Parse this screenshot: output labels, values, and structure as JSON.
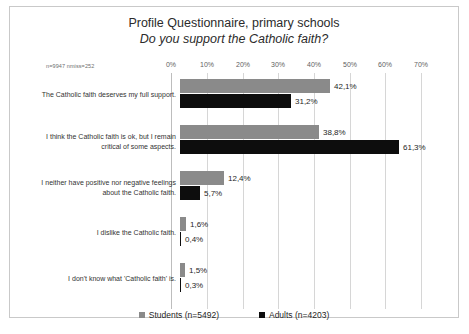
{
  "chart_data": {
    "type": "bar",
    "orientation": "horizontal",
    "title": "Profile Questionnaire, primary schools",
    "subtitle": "Do you support the Catholic faith?",
    "note": "n=9947 nmiss=252",
    "xlabel": "",
    "ylabel": "",
    "xlim": [
      0,
      70
    ],
    "xtick_labels": [
      "0%",
      "10%",
      "20%",
      "30%",
      "40%",
      "50%",
      "60%",
      "70%"
    ],
    "xtick_values": [
      0,
      10,
      20,
      30,
      40,
      50,
      60,
      70
    ],
    "grid": true,
    "legend_position": "bottom",
    "categories": [
      "The Catholic faith deserves my full support.",
      "I think the Catholic faith is ok, but I remain critical of some aspects.",
      "I neither have positive nor negative feelings about the Catholic faith.",
      "I dislike the Catholic faith.",
      "I don't know what 'Catholic faith' is."
    ],
    "series": [
      {
        "name": "Students (n=5492)",
        "color": "#8a8a8a",
        "values": [
          42.1,
          38.8,
          12.4,
          1.6,
          1.5
        ],
        "labels": [
          "42,1%",
          "38,8%",
          "12,4%",
          "1,6%",
          "1,5%"
        ]
      },
      {
        "name": "Adults (n=4203)",
        "color": "#0d0d0d",
        "values": [
          31.2,
          61.3,
          5.7,
          0.4,
          0.3
        ],
        "labels": [
          "31,2%",
          "61,3%",
          "5,7%",
          "0,4%",
          "0,3%"
        ]
      }
    ]
  }
}
